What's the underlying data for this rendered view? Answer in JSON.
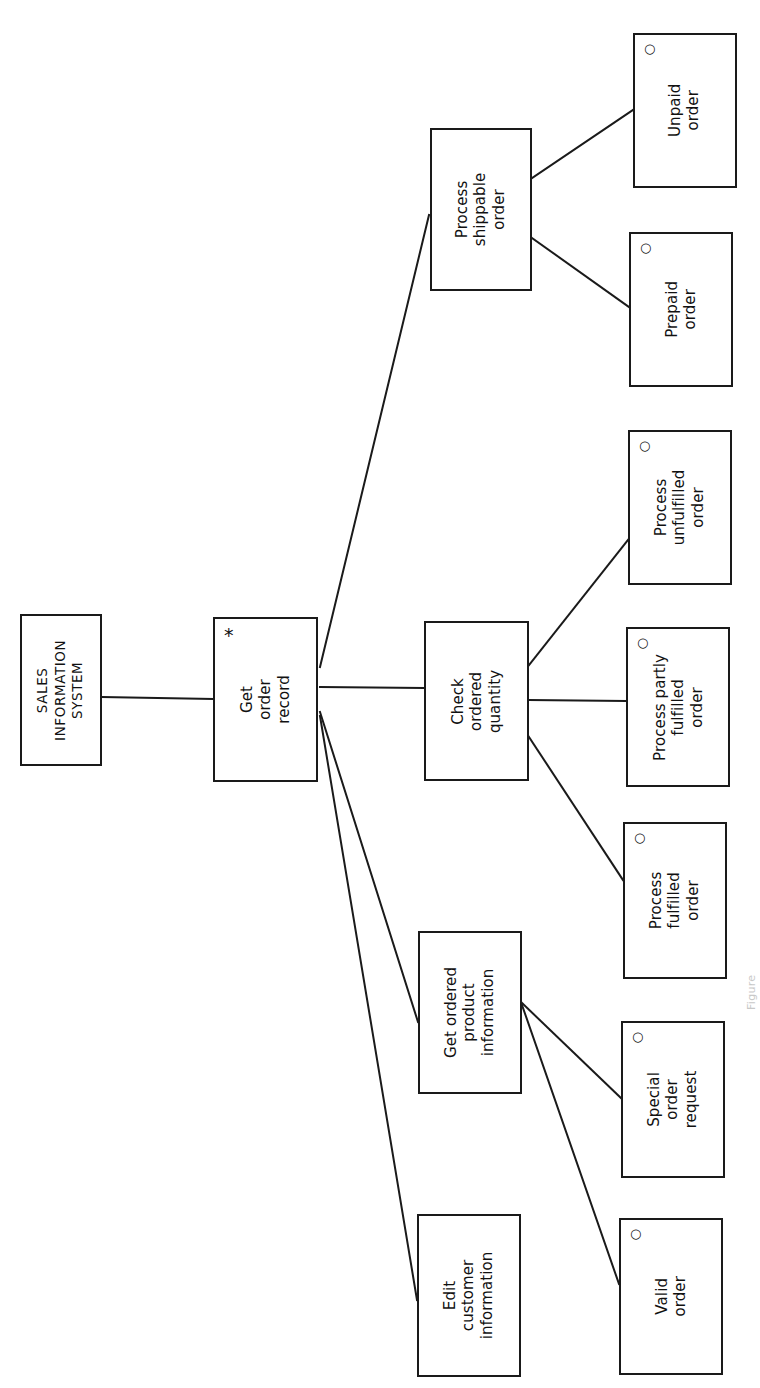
{
  "figure": {
    "kind": "jackson-structure-diagram",
    "orientation": "rotated-90-ccw",
    "background_color": "#ffffff",
    "line_color": "#1a1a1a",
    "text_color": "#111111",
    "caption": "Figure"
  },
  "markers": {
    "iteration_glyph": "*",
    "iteration_meaning": "iteration",
    "selection_glyph": "○",
    "selection_meaning": "selection"
  },
  "nodes": [
    {
      "id": "root",
      "label": "SALES\nINFORMATION\nSYSTEM",
      "marker": "",
      "x": 20,
      "y": 614,
      "w": 82,
      "h": 152
    },
    {
      "id": "get-order-record",
      "label": "Get\norder\nrecord",
      "marker": "*",
      "x": 213,
      "y": 617,
      "w": 105,
      "h": 165
    },
    {
      "id": "process-shippable-order",
      "label": "Process\nshippable\norder",
      "marker": "",
      "x": 430,
      "y": 128,
      "w": 102,
      "h": 163
    },
    {
      "id": "check-ordered-quantity",
      "label": "Check\nordered\nquantity",
      "marker": "",
      "x": 424,
      "y": 621,
      "w": 105,
      "h": 160
    },
    {
      "id": "get-ordered-product-information",
      "label": "Get ordered\nproduct\ninformation",
      "marker": "",
      "x": 418,
      "y": 931,
      "w": 104,
      "h": 163
    },
    {
      "id": "edit-customer-information",
      "label": "Edit\ncustomer\ninformation",
      "marker": "",
      "x": 417,
      "y": 1214,
      "w": 104,
      "h": 163
    },
    {
      "id": "unpaid-order",
      "label": "Unpaid\norder",
      "marker": "○",
      "x": 633,
      "y": 33,
      "w": 104,
      "h": 155
    },
    {
      "id": "prepaid-order",
      "label": "Prepaid\norder",
      "marker": "○",
      "x": 629,
      "y": 232,
      "w": 104,
      "h": 155
    },
    {
      "id": "process-unfulfilled-order",
      "label": "Process\nunfulfilled\norder",
      "marker": "○",
      "x": 628,
      "y": 430,
      "w": 104,
      "h": 155
    },
    {
      "id": "process-partly-fulfilled-order",
      "label": "Process partly\nfulfilled\norder",
      "marker": "○",
      "x": 626,
      "y": 627,
      "w": 104,
      "h": 160
    },
    {
      "id": "process-fulfilled-order",
      "label": "Process\nfulfilled\norder",
      "marker": "○",
      "x": 623,
      "y": 822,
      "w": 104,
      "h": 157
    },
    {
      "id": "special-order-request",
      "label": "Special\norder\nrequest",
      "marker": "○",
      "x": 621,
      "y": 1021,
      "w": 104,
      "h": 157
    },
    {
      "id": "valid-order",
      "label": "Valid\norder",
      "marker": "○",
      "x": 619,
      "y": 1218,
      "w": 104,
      "h": 157
    }
  ],
  "connections": [
    {
      "id": "root-to-get-order-record",
      "from": "root",
      "to": "get-order-record",
      "x1": 102,
      "y1": 697,
      "x2": 213,
      "y2": 699
    },
    {
      "id": "get-order-record-to-process-shippable-order",
      "from": "get-order-record",
      "to": "process-shippable-order",
      "x1": 320,
      "y1": 667,
      "x2": 429,
      "y2": 215
    },
    {
      "id": "get-order-record-to-check-ordered-quantity",
      "from": "get-order-record",
      "to": "check-ordered-quantity",
      "x1": 320,
      "y1": 687,
      "x2": 424,
      "y2": 688
    },
    {
      "id": "get-order-record-to-get-ordered-product-information",
      "from": "get-order-record",
      "to": "get-ordered-product-information",
      "x1": 320,
      "y1": 712,
      "x2": 418,
      "y2": 1022
    },
    {
      "id": "get-order-record-to-edit-customer-information",
      "from": "get-order-record",
      "to": "edit-customer-information",
      "x1": 320,
      "y1": 716,
      "x2": 417,
      "y2": 1300
    },
    {
      "id": "process-shippable-order-to-unpaid-order",
      "from": "process-shippable-order",
      "to": "unpaid-order",
      "x1": 532,
      "y1": 178,
      "x2": 633,
      "y2": 110
    },
    {
      "id": "process-shippable-order-to-prepaid-order",
      "from": "process-shippable-order",
      "to": "prepaid-order",
      "x1": 532,
      "y1": 238,
      "x2": 629,
      "y2": 307
    },
    {
      "id": "check-ordered-quantity-to-process-unfulfilled-order",
      "from": "check-ordered-quantity",
      "to": "process-unfulfilled-order",
      "x1": 529,
      "y1": 665,
      "x2": 628,
      "y2": 540
    },
    {
      "id": "check-ordered-quantity-to-process-partly-fulfilled-order",
      "from": "check-ordered-quantity",
      "to": "process-partly-fulfilled-order",
      "x1": 529,
      "y1": 700,
      "x2": 626,
      "y2": 701
    },
    {
      "id": "check-ordered-quantity-to-process-fulfilled-order",
      "from": "check-ordered-quantity",
      "to": "process-fulfilled-order",
      "x1": 529,
      "y1": 737,
      "x2": 623,
      "y2": 880
    },
    {
      "id": "get-ordered-product-information-to-special-order-request",
      "from": "get-ordered-product-information",
      "to": "special-order-request",
      "x1": 522,
      "y1": 1003,
      "x2": 621,
      "y2": 1098
    },
    {
      "id": "get-ordered-product-information-to-valid-order",
      "from": "get-ordered-product-information",
      "to": "valid-order",
      "x1": 522,
      "y1": 1005,
      "x2": 619,
      "y2": 1284
    }
  ],
  "chart_data": {
    "type": "tree",
    "notation": "Jackson structure diagram",
    "levels": 4,
    "root": "SALES INFORMATION SYSTEM",
    "hierarchy": [
      {
        "label": "SALES INFORMATION SYSTEM",
        "marker": "",
        "children": [
          {
            "label": "Get order record",
            "marker": "*",
            "children": [
              {
                "label": "Process shippable order",
                "marker": "",
                "children": [
                  {
                    "label": "Unpaid order",
                    "marker": "○",
                    "children": []
                  },
                  {
                    "label": "Prepaid order",
                    "marker": "○",
                    "children": []
                  }
                ]
              },
              {
                "label": "Check ordered quantity",
                "marker": "",
                "children": [
                  {
                    "label": "Process unfulfilled order",
                    "marker": "○",
                    "children": []
                  },
                  {
                    "label": "Process partly fulfilled order",
                    "marker": "○",
                    "children": []
                  },
                  {
                    "label": "Process fulfilled order",
                    "marker": "○",
                    "children": []
                  }
                ]
              },
              {
                "label": "Get ordered product information",
                "marker": "",
                "children": [
                  {
                    "label": "Special order request",
                    "marker": "○",
                    "children": []
                  },
                  {
                    "label": "Valid order",
                    "marker": "○",
                    "children": []
                  }
                ]
              },
              {
                "label": "Edit customer information",
                "marker": "",
                "children": []
              }
            ]
          }
        ]
      }
    ]
  }
}
